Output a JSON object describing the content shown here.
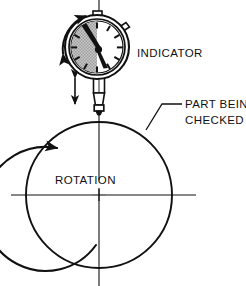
{
  "figure": {
    "background_color": "#ffffff",
    "line_color": "#111111",
    "dial_shade_color": "#b3b3b3"
  },
  "labels": {
    "indicator": "INDICATOR",
    "part_line1": "PART BEING",
    "part_line2": "CHECKED",
    "rotation": "ROTATION"
  },
  "icons": {
    "dial_needle": "needle-pointer",
    "swing_arrow": "double-curved-arrow",
    "plunger_arrow": "double-vertical-arrow",
    "rotation_arrow": "counterclockwise-arc-arrow",
    "leader": "leader-line"
  },
  "geometry": {
    "part_circle": {
      "cx": 99,
      "cy": 195,
      "r": 73
    },
    "dial_circle": {
      "cx": 97,
      "cy": 47,
      "r": 32
    },
    "center_mark": {
      "x": 99,
      "y": 195
    },
    "horizontal_centerline": {
      "x1": 11,
      "x2": 196,
      "y": 195
    },
    "vertical_centerline": {
      "x": 99,
      "y1": 0,
      "y2": 286
    }
  }
}
